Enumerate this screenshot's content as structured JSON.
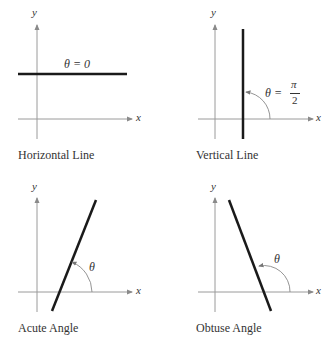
{
  "panels": [
    {
      "caption": "Horizontal Line",
      "angle_label": "θ = 0",
      "x_label": "x",
      "y_label": "y"
    },
    {
      "caption": "Vertical Line",
      "angle_label_prefix": "θ =",
      "angle_num": "π",
      "angle_den": "2",
      "x_label": "x",
      "y_label": "y"
    },
    {
      "caption": "Acute Angle",
      "angle_label": "θ",
      "x_label": "x",
      "y_label": "y"
    },
    {
      "caption": "Obtuse Angle",
      "angle_label": "θ",
      "x_label": "x",
      "y_label": "y"
    }
  ],
  "colors": {
    "axis": "#9a9a9a",
    "line": "#1a1a1a",
    "arc": "#888888",
    "text": "#333333"
  }
}
